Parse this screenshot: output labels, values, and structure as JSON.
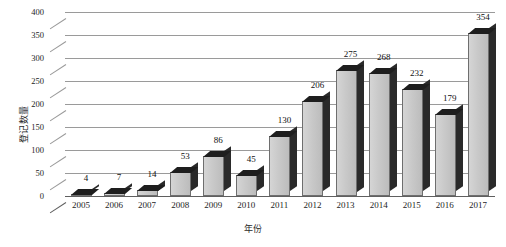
{
  "chart_data": {
    "type": "bar",
    "title": "",
    "xlabel": "年份",
    "ylabel": "登记数量",
    "categories": [
      "2005",
      "2006",
      "2007",
      "2008",
      "2009",
      "2010",
      "2011",
      "2012",
      "2013",
      "2014",
      "2015",
      "2016",
      "2017"
    ],
    "values": [
      4,
      7,
      14,
      53,
      86,
      45,
      130,
      206,
      275,
      268,
      232,
      179,
      354
    ],
    "data_labels": [
      "4",
      "7",
      "14",
      "53",
      "86",
      "45",
      "130",
      "206",
      "275",
      "268",
      "232",
      "179",
      "354"
    ],
    "ylim": [
      0,
      400
    ],
    "ytick_step": 50,
    "ytick_labels": [
      "400",
      "350",
      "300",
      "250",
      "200",
      "150",
      "100",
      "50",
      "0"
    ],
    "ytick_values": [
      400,
      350,
      300,
      250,
      200,
      150,
      100,
      50,
      0
    ],
    "grid": true,
    "grid_axis": "y",
    "legend": false,
    "legend_position": "none",
    "style": "3d-columns",
    "series": [
      {
        "name": "登记数量",
        "values": [
          4,
          7,
          14,
          53,
          86,
          45,
          130,
          206,
          275,
          268,
          232,
          179,
          354
        ]
      }
    ]
  },
  "colors": {
    "bar_face": "#c9c9c9",
    "bar_shadow": "#2a2a2a",
    "gridline": "#9a9a9a",
    "axis": "#5f5f5f",
    "text": "#1d1d1d",
    "background": "#ffffff"
  }
}
